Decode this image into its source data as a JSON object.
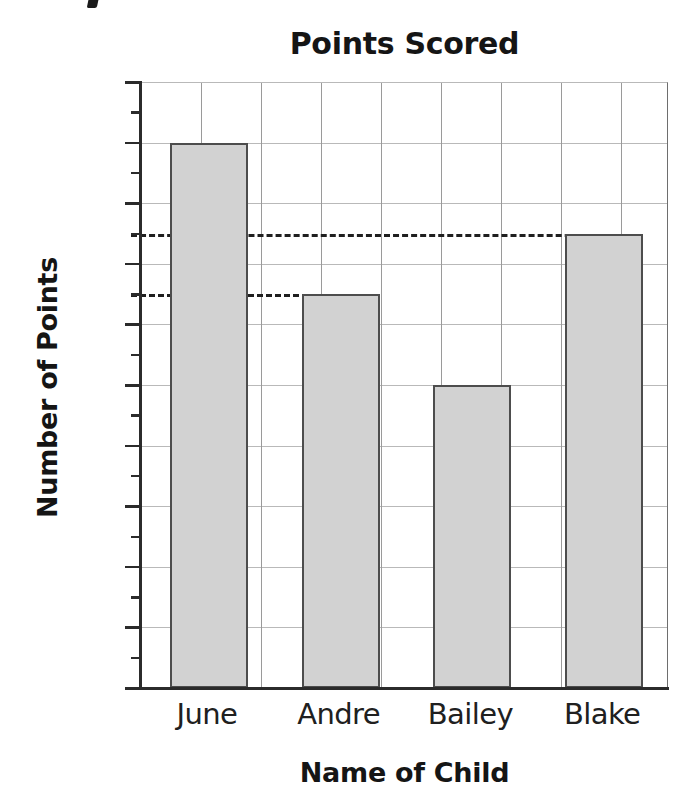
{
  "chart_data": {
    "type": "bar",
    "title": "Points Scored",
    "xlabel": "Name of Child",
    "ylabel": "Number of Points",
    "categories": [
      "June",
      "Andre",
      "Bailey",
      "Blake"
    ],
    "values": [
      90,
      65,
      50,
      75
    ],
    "ylim": [
      0,
      100
    ],
    "ytick_major": [
      0,
      10,
      20,
      30,
      40,
      50,
      60,
      70,
      80,
      90,
      100
    ],
    "ytick_major_labels": [
      "0",
      "10",
      "20",
      "30",
      "40",
      "50",
      "60",
      "70",
      "80",
      "90",
      "100"
    ],
    "ytick_minor": [
      5,
      15,
      25,
      35,
      45,
      55,
      65,
      75,
      85,
      95
    ],
    "grid": true,
    "grid_axis": "both",
    "legend": "none",
    "bar_fill_color": "#d2d2d2",
    "bar_edge_color": "#4d4d4d",
    "gridline_color": "#b9b9b9",
    "axis_color": "#2b2b2b",
    "text_color": "#151515",
    "annotations": [
      {
        "name": "reference-line-75",
        "value": 75,
        "style": "dashed",
        "from_category": "axis",
        "to_category": "Blake",
        "label": ""
      },
      {
        "name": "reference-line-65",
        "value": 65,
        "style": "dashed",
        "from_category": "axis",
        "to_category": "Andre",
        "label": ""
      }
    ]
  }
}
